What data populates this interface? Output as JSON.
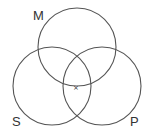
{
  "diagram": {
    "type": "venn",
    "sets": [
      {
        "label": "M",
        "position": "top"
      },
      {
        "label": "S",
        "position": "bottom-left"
      },
      {
        "label": "P",
        "position": "bottom-right"
      }
    ],
    "marker": {
      "symbol": "×",
      "location": "on M boundary, inside S∩P"
    },
    "colors": {
      "stroke": "#555555",
      "text": "#333333",
      "background": "#ffffff"
    }
  }
}
